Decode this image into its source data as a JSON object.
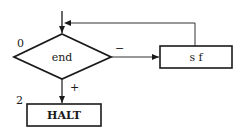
{
  "diagram": {
    "type": "flowchart",
    "nodes": [
      {
        "id": "decision",
        "shape": "diamond",
        "label": "end",
        "index_label": "0"
      },
      {
        "id": "process",
        "shape": "rectangle",
        "label": "s f"
      },
      {
        "id": "halt",
        "shape": "rectangle",
        "label": "HALT",
        "index_label": "2"
      }
    ],
    "edges": [
      {
        "from": "entry",
        "to": "decision",
        "label": ""
      },
      {
        "from": "decision",
        "to": "process",
        "label": "−"
      },
      {
        "from": "process",
        "to": "decision",
        "label": ""
      },
      {
        "from": "decision",
        "to": "halt",
        "label": "+"
      }
    ]
  },
  "labels": {
    "decision_index": "0",
    "decision_text": "end",
    "minus_branch": "−",
    "plus_branch": "+",
    "process_text": "s f",
    "halt_index": "2",
    "halt_text": "HALT"
  },
  "colors": {
    "stroke": "#1a1a1a",
    "background": "#ffffff"
  }
}
